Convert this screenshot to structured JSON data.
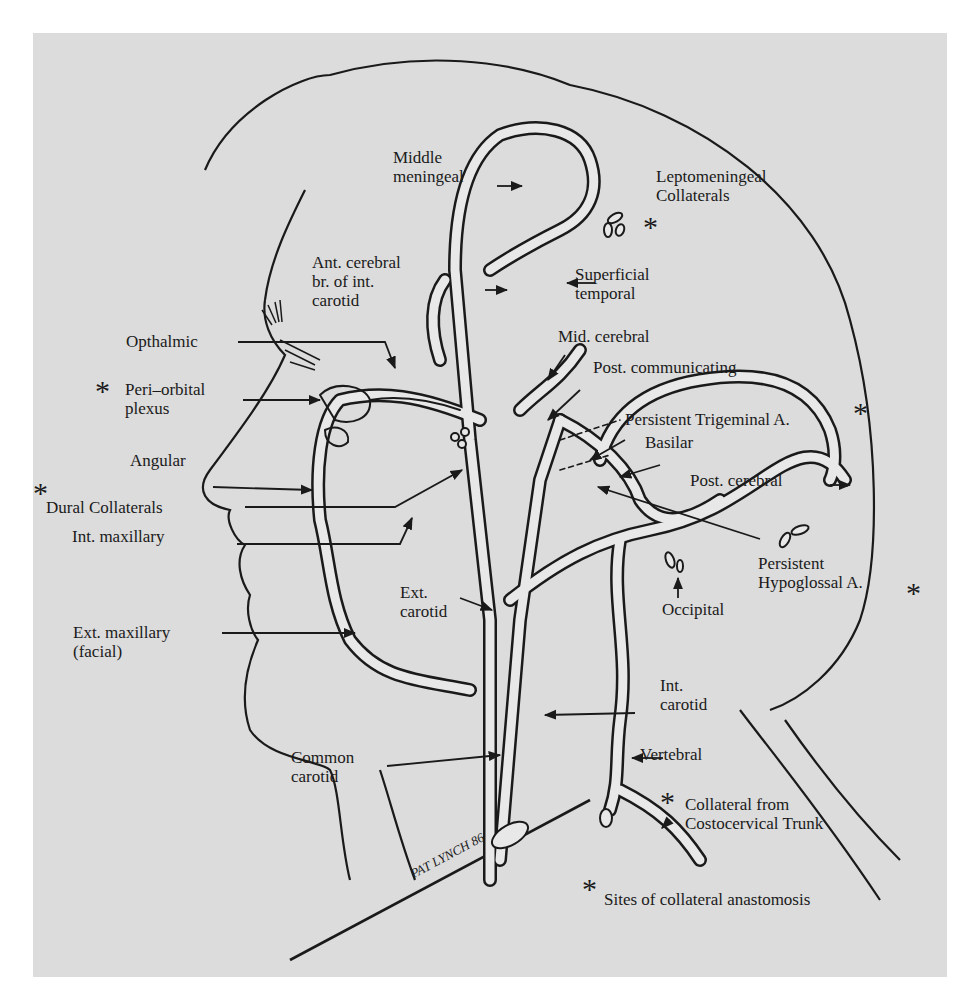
{
  "figure": {
    "signature": "PAT LYNCH 86",
    "legend": {
      "symbol": "*",
      "text": "Sites of collateral anastomosis"
    }
  },
  "labels": {
    "middle_meningeal": [
      "Middle",
      "meningeal"
    ],
    "leptomeningeal": [
      "Leptomeningeal",
      "Collaterals"
    ],
    "ant_cerebral": [
      "Ant. cerebral",
      "br. of int.",
      "carotid"
    ],
    "superficial_temporal": [
      "Superficial",
      "temporal"
    ],
    "opthalmic": "Opthalmic",
    "mid_cerebral": "Mid. cerebral",
    "peri_orbital": [
      "Peri–orbital",
      "plexus"
    ],
    "post_communicating": "Post. communicating",
    "persistent_trigeminal": "Persistent Trigeminal A.",
    "basilar": "Basilar",
    "angular": "Angular",
    "post_cerebral": "Post. cerebral",
    "dural_collaterals": "Dural Collaterals",
    "int_maxillary": "Int. maxillary",
    "persistent_hypoglossal": [
      "Persistent",
      "Hypoglossal A."
    ],
    "ext_carotid": [
      "Ext.",
      "carotid"
    ],
    "occipital": "Occipital",
    "ext_maxillary": [
      "Ext. maxillary",
      "(facial)"
    ],
    "int_carotid": [
      "Int.",
      "carotid"
    ],
    "common_carotid": [
      "Common",
      "carotid"
    ],
    "vertebral": "Vertebral",
    "costocervical": [
      "Collateral from",
      "Costocervical Trunk"
    ]
  },
  "collateral_sites": [
    "Leptomeningeal Collaterals",
    "Peri–orbital plexus",
    "Dural Collaterals",
    "Persistent Trigeminal A.",
    "Persistent Hypoglossal A.",
    "Collateral from Costocervical Trunk"
  ],
  "colors": {
    "background": "#ffffff",
    "panel": "#dcdcdc",
    "ink": "#1a1a1a",
    "vessel_fill": "#e8e8e8"
  }
}
